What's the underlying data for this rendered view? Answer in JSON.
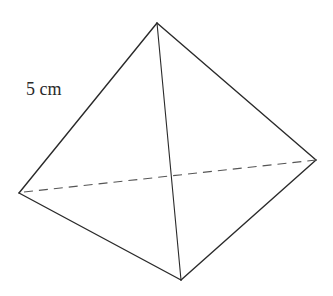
{
  "diagram": {
    "type": "tetrahedron",
    "edge_label": "5 cm",
    "colors": {
      "edge": "#2a2a2a",
      "hidden_edge": "#555555",
      "background": "#ffffff"
    },
    "vertices": {
      "top": [
        157,
        23
      ],
      "left": [
        19,
        193
      ],
      "right": [
        316,
        160
      ],
      "bottom": [
        181,
        280
      ]
    },
    "edges": [
      {
        "from": "top",
        "to": "left",
        "style": "solid"
      },
      {
        "from": "top",
        "to": "right",
        "style": "solid"
      },
      {
        "from": "top",
        "to": "bottom",
        "style": "solid"
      },
      {
        "from": "left",
        "to": "bottom",
        "style": "solid"
      },
      {
        "from": "right",
        "to": "bottom",
        "style": "solid"
      },
      {
        "from": "left",
        "to": "right",
        "style": "dashed"
      }
    ]
  }
}
